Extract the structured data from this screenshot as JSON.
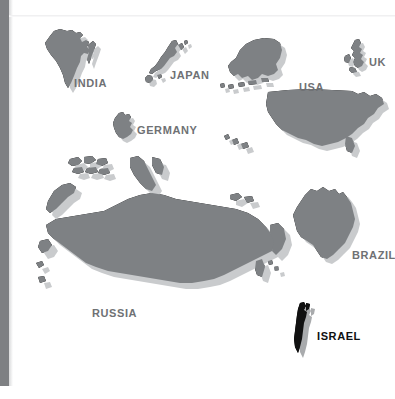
{
  "map": {
    "title": "World Countries Silhouette Map",
    "background_color": "#ffffff",
    "shape_fill": "#7e8184",
    "shape_shadow": "#c9cbcd",
    "highlight_fill": "#111111",
    "label_color": "#6f7174",
    "highlight_label_color": "#101010",
    "left_bar_color": "#7e8083"
  },
  "countries": [
    {
      "id": "india",
      "label": "INDIA",
      "highlighted": false,
      "label_x": 74,
      "label_y": 77,
      "shape_x": 36,
      "shape_y": 28,
      "shape_w": 62,
      "shape_h": 62
    },
    {
      "id": "japan",
      "label": "JAPAN",
      "highlighted": false,
      "label_x": 170,
      "label_y": 69,
      "shape_x": 142,
      "shape_y": 39,
      "shape_w": 42,
      "shape_h": 45
    },
    {
      "id": "usa",
      "label": "USA",
      "highlighted": false,
      "label_x": 299,
      "label_y": 81,
      "shape_x": 218,
      "shape_y": 36,
      "shape_w": 168,
      "shape_h": 126
    },
    {
      "id": "uk",
      "label": "UK",
      "highlighted": false,
      "label_x": 369,
      "label_y": 56,
      "shape_x": 343,
      "shape_y": 38,
      "shape_w": 24,
      "shape_h": 32
    },
    {
      "id": "germany",
      "label": "GERMANY",
      "highlighted": false,
      "label_x": 137,
      "label_y": 124,
      "shape_x": 110,
      "shape_y": 111,
      "shape_w": 27,
      "shape_h": 30
    },
    {
      "id": "russia",
      "label": "RUSSIA",
      "highlighted": false,
      "label_x": 92,
      "label_y": 307,
      "shape_x": 34,
      "shape_y": 155,
      "shape_w": 252,
      "shape_h": 158
    },
    {
      "id": "brazil",
      "label": "BRAZIL",
      "highlighted": false,
      "label_x": 352,
      "label_y": 249,
      "shape_x": 285,
      "shape_y": 185,
      "shape_w": 75,
      "shape_h": 83
    },
    {
      "id": "israel",
      "label": "ISRAEL",
      "highlighted": true,
      "label_x": 317,
      "label_y": 330,
      "shape_x": 290,
      "shape_y": 301,
      "shape_w": 24,
      "shape_h": 52
    }
  ]
}
